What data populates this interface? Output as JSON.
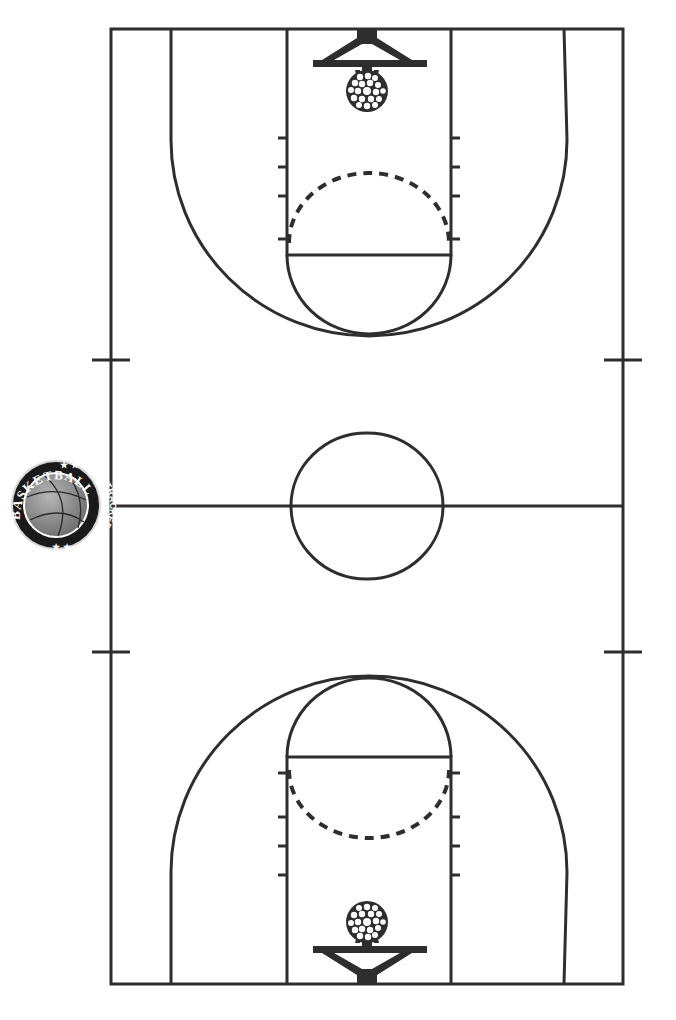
{
  "page": {
    "background": "#ffffff",
    "line_color": "#2e2e2e"
  },
  "logo": {
    "top_text": "BASKETBALL",
    "side_text": "STAT TRACKER",
    "stars": "★ ★",
    "ball_color": "#8a8a8a",
    "ring_color": "#1a1a1a"
  },
  "court": {
    "orientation": "vertical",
    "halves": [
      "top",
      "bottom"
    ]
  }
}
